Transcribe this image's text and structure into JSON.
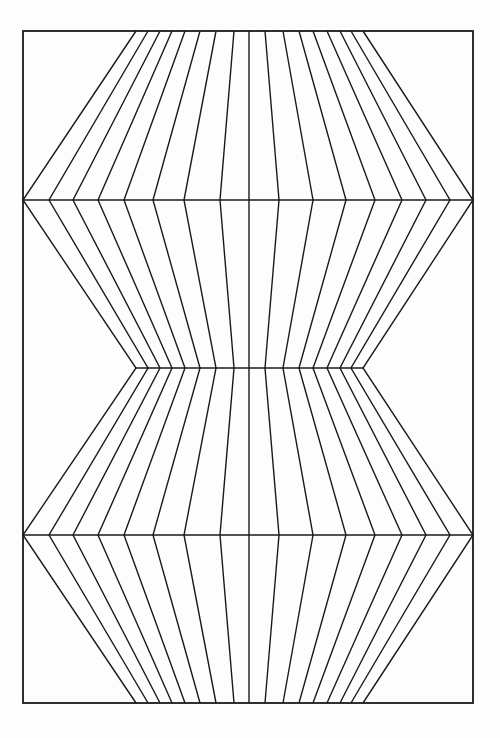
{
  "artwork": {
    "description": "Op-art line drawing: vertical lines zigzag between narrow and wide waists, forming an hourglass/bow-tie illusion",
    "line_color": "#1a1a1a",
    "background_color": "#fdfdfd",
    "line_count": 17,
    "waist_rows": [
      "narrow",
      "wide",
      "narrow",
      "wide",
      "narrow"
    ],
    "horizontal_dividers": [
      "wide-1",
      "narrow-middle",
      "wide-2"
    ]
  }
}
